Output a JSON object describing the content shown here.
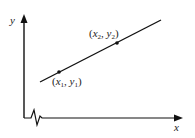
{
  "diagram": {
    "type": "line-through-two-points",
    "axes": {
      "x_label": "x",
      "y_label": "y",
      "axis_break": "zigzag on x-axis near origin"
    },
    "points": [
      {
        "name": "point-1",
        "x_sym": "x",
        "x_sub": "1",
        "y_sym": "y",
        "y_sub": "1"
      },
      {
        "name": "point-2",
        "x_sym": "x",
        "x_sub": "2",
        "y_sym": "y",
        "y_sub": "2"
      }
    ],
    "colors": {
      "line": "#111111",
      "text": "#222222",
      "background": "#ffffff"
    }
  }
}
